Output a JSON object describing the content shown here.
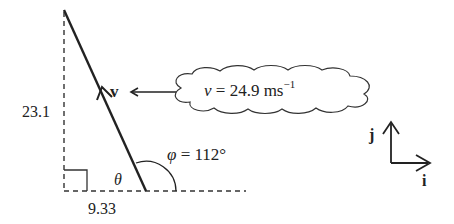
{
  "diagram": {
    "vector_label": "v",
    "speed_label": {
      "symbol": "v",
      "equals": " = 24.9 ms",
      "exponent": "−1"
    },
    "vertical_component": "23.1",
    "horizontal_component": "9.33",
    "angle_theta": "θ",
    "angle_phi": {
      "symbol": "φ",
      "text": " = 112°"
    },
    "unit_vectors": {
      "i": "i",
      "j": "j"
    },
    "colors": {
      "line": "#222222",
      "dashed": "#333333",
      "background": "#ffffff"
    }
  }
}
